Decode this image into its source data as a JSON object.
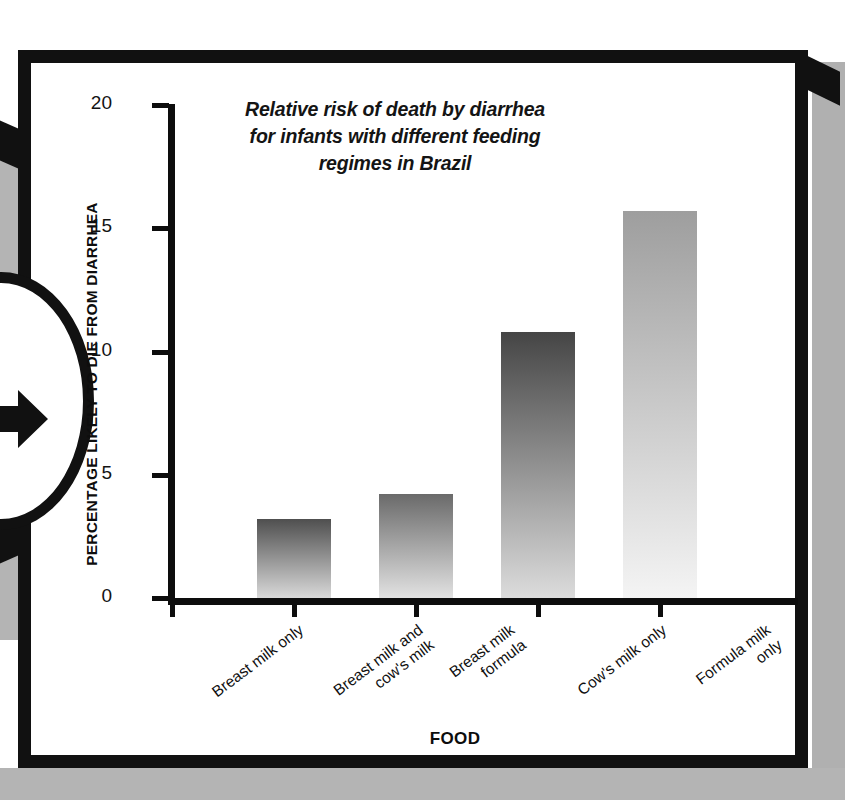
{
  "chart_data": {
    "type": "bar",
    "title": "Relative risk of death by diarrhea for infants with different feeding regimes in Brazil",
    "title_lines": [
      "Relative risk of death by diarrhea",
      "for infants with different feeding",
      "regimes in Brazil"
    ],
    "xlabel": "FOOD",
    "ylabel": "PERCENTAGE LIKELY TO DIE FROM DIARRHEA",
    "ylim": [
      0,
      20
    ],
    "ytick_labels": [
      "0",
      "5",
      "10",
      "15",
      "20"
    ],
    "ytick_values": [
      0,
      5,
      10,
      15,
      20
    ],
    "grid": false,
    "legend": false,
    "categories": [
      "Breast milk only",
      "Breast milk and cow's milk",
      "Breast milk formula",
      "Cow's milk only",
      "Formula milk only"
    ],
    "category_lines": [
      [
        "Breast milk only"
      ],
      [
        "Breast milk and",
        "cow's milk"
      ],
      [
        "Breast milk",
        "formula"
      ],
      [
        "Cow's milk only"
      ],
      [
        "Formula milk",
        "only"
      ]
    ],
    "values": [
      0,
      3.2,
      4.2,
      10.8,
      15.7
    ],
    "bar_gradients": [
      {
        "top": "#3a3a3a",
        "bottom": "#e8e8e8"
      },
      {
        "top": "#4f4f4f",
        "bottom": "#d9d9d9"
      },
      {
        "top": "#6a6a6a",
        "bottom": "#e2e2e2"
      },
      {
        "top": "#454545",
        "bottom": "#dcdcdc"
      },
      {
        "top": "#9e9e9e",
        "bottom": "#f4f4f4"
      }
    ]
  },
  "colors": {
    "frame": "#111111",
    "axis": "#0d0d0d",
    "panel_background": "#ffffff",
    "page_background": "#b4b4b4",
    "text": "#131313"
  },
  "nav": {
    "next_arrow": "arrow-right-icon"
  }
}
